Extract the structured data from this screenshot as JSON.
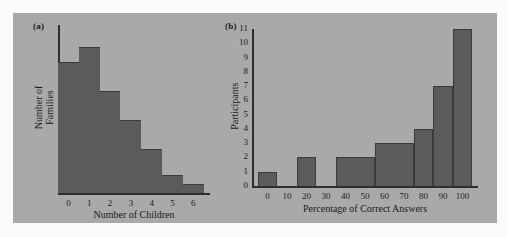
{
  "figure": {
    "background_color": "#fbfbfb",
    "plate_color": "#a8a9a8",
    "bar_color": "#5a5b5a",
    "axis_color": "#2e2e2e",
    "text_color": "#1c1c1c"
  },
  "panels": {
    "a": {
      "tag": "(a)",
      "xlabel": "Number of Children",
      "ylabel_line1": "Number of",
      "ylabel_line2": "Families",
      "xticks": [
        "0",
        "1",
        "2",
        "3",
        "4",
        "5",
        "6"
      ]
    },
    "b": {
      "tag": "(b)",
      "xlabel": "Percentage of Correct Answers",
      "ylabel": "Participants",
      "xticks": [
        "0",
        "10",
        "20",
        "30",
        "40",
        "50",
        "60",
        "70",
        "80",
        "90",
        "100"
      ],
      "yticks": [
        "0",
        "1",
        "2",
        "3",
        "4",
        "5",
        "6",
        "7",
        "8",
        "9",
        "10",
        "11"
      ]
    }
  },
  "chart_data": [
    {
      "type": "bar",
      "panel": "a",
      "title": "(a)",
      "xlabel": "Number of Children",
      "ylabel": "Number of Families",
      "categories": [
        "0",
        "1",
        "2",
        "3",
        "4",
        "5",
        "6"
      ],
      "values": [
        9,
        10,
        7,
        5,
        3,
        1.2,
        0.6
      ],
      "bin_edges": [
        -0.5,
        0.5,
        1.5,
        2.5,
        3.5,
        4.5,
        5.5,
        6.5
      ],
      "xlim": [
        -0.5,
        6.8
      ],
      "ylim": [
        0,
        11.5
      ],
      "grid": false,
      "legend": "none",
      "note": "y-axis has no tick labels; bar heights read relative to each other"
    },
    {
      "type": "bar",
      "panel": "b",
      "title": "(b)",
      "xlabel": "Percentage of Correct Answers",
      "ylabel": "Participants",
      "bin_edges": [
        -5,
        5,
        15,
        25,
        35,
        55,
        75,
        85,
        95,
        105
      ],
      "bin_labels": [
        "-5-5",
        "5-15",
        "15-25",
        "25-35",
        "35-55",
        "55-75",
        "75-85",
        "85-95",
        "95-105"
      ],
      "values": [
        1,
        0,
        2,
        0,
        2,
        3,
        4,
        7,
        11
      ],
      "xlim": [
        -8,
        108
      ],
      "ylim": [
        0,
        11
      ],
      "xticks": [
        0,
        10,
        20,
        30,
        40,
        50,
        60,
        70,
        80,
        90,
        100
      ],
      "yticks": [
        0,
        1,
        2,
        3,
        4,
        5,
        6,
        7,
        8,
        9,
        10,
        11
      ],
      "grid": false,
      "legend": "none"
    }
  ]
}
